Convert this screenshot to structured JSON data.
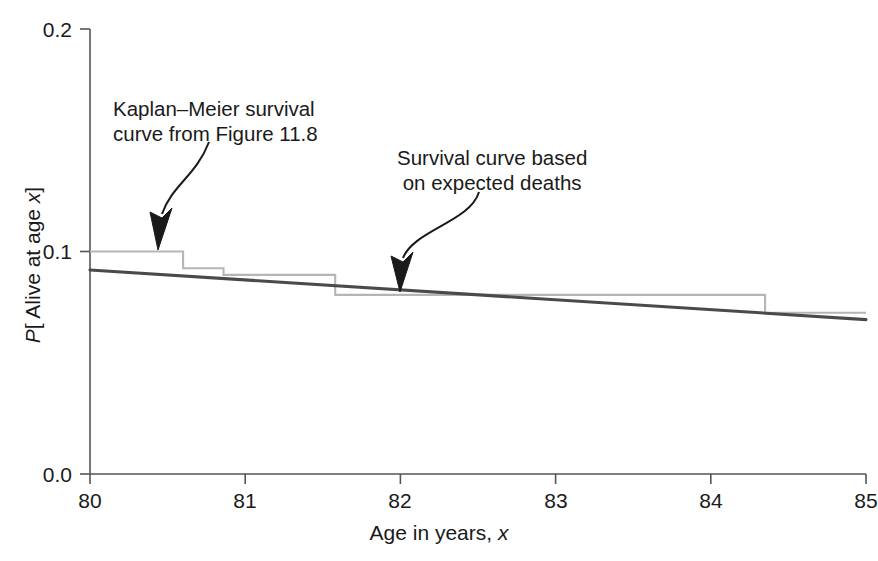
{
  "chart_data": {
    "type": "line",
    "title": "",
    "xlabel": "Age in years, x",
    "ylabel": "P[ Alive at age x]",
    "xlim": [
      80,
      85
    ],
    "ylim": [
      0.0,
      0.2
    ],
    "xticks": [
      80,
      81,
      82,
      83,
      84,
      85
    ],
    "xtick_labels": [
      "80",
      "81",
      "82",
      "83",
      "84",
      "85"
    ],
    "yticks": [
      0.0,
      0.1,
      0.2
    ],
    "ytick_labels": [
      "0.0",
      "0.1",
      "0.2"
    ],
    "grid": false,
    "legend_position": "none",
    "series": [
      {
        "name": "Kaplan-Meier survival curve from Figure 11.8",
        "style": "step",
        "color": "#b5b5b5",
        "x": [
          80.0,
          80.6,
          80.6,
          80.86,
          80.86,
          81.5,
          81.5,
          81.58,
          81.58,
          84.35,
          84.35,
          85.0
        ],
        "y": [
          0.1,
          0.1,
          0.0925,
          0.0925,
          0.0895,
          0.0895,
          0.0895,
          0.0895,
          0.0805,
          0.0805,
          0.0725,
          0.0725
        ]
      },
      {
        "name": "Survival curve based on expected deaths",
        "style": "line",
        "color": "#4a4a4a",
        "x": [
          80.0,
          85.0
        ],
        "y": [
          0.0917,
          0.0694
        ]
      }
    ],
    "annotations": [
      {
        "id": "km-annotation",
        "lines": [
          "Kaplan–Meier survival",
          "curve from Figure 11.8"
        ],
        "target_x": 80.27,
        "target_y": 0.1
      },
      {
        "id": "expected-annotation",
        "lines": [
          "Survival curve based",
          "on expected deaths"
        ],
        "target_x": 82.0,
        "target_y": 0.0843
      }
    ]
  },
  "axes": {
    "y_title_prefix": "P",
    "y_title_mid": "[ Alive at age ",
    "y_title_var": "x",
    "y_title_suffix": "]",
    "x_title_text": "Age in years, ",
    "x_title_var": "x"
  },
  "colors": {
    "km_curve": "#b5b5b5",
    "expected_curve": "#4a4a4a",
    "axis": "#555555",
    "text": "#1a1a1a",
    "background": "#ffffff"
  }
}
